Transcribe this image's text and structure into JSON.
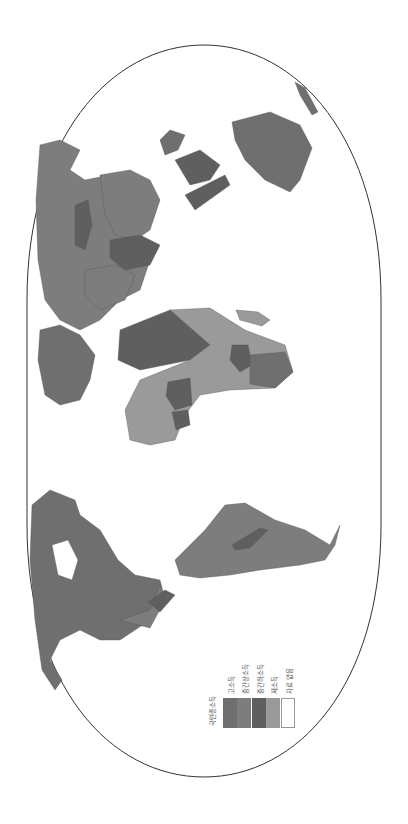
{
  "map": {
    "projection": "rotated-robinson-outline",
    "orientation": "rotated 90deg counter-clockwise (north points left)",
    "outline_color": "#333333",
    "ocean_color": "#ffffff",
    "border_color": "#555555"
  },
  "legend": {
    "title": "국민총소득",
    "items": [
      {
        "label": "고소득",
        "color": "#6f6f6f"
      },
      {
        "label": "중간상소득",
        "color": "#7d7d7d"
      },
      {
        "label": "중간하소득",
        "color": "#5f5f5f"
      },
      {
        "label": "저소득",
        "color": "#9a9a9a"
      },
      {
        "label": "자료 없음",
        "color": "#ffffff"
      }
    ]
  },
  "regions": [
    {
      "name": "north-america",
      "income": "고소득"
    },
    {
      "name": "south-america",
      "income": "중간상소득"
    },
    {
      "name": "europe",
      "income": "고소득"
    },
    {
      "name": "russia",
      "income": "중간상소득"
    },
    {
      "name": "africa",
      "income": "저소득"
    },
    {
      "name": "middle-east",
      "income": "중간상소득"
    },
    {
      "name": "south-asia",
      "income": "중간하소득"
    },
    {
      "name": "china",
      "income": "중간상소득"
    },
    {
      "name": "southeast-asia",
      "income": "중간하소득"
    },
    {
      "name": "australia",
      "income": "고소득"
    },
    {
      "name": "greenland",
      "income": "자료 없음"
    },
    {
      "name": "antarctica",
      "income": "자료 없음"
    }
  ]
}
